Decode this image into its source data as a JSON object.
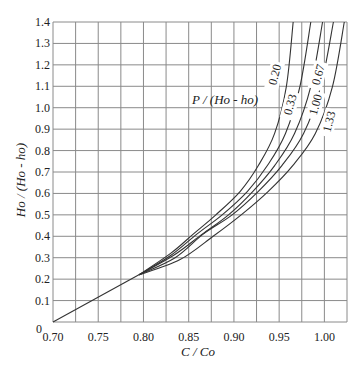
{
  "chart_data": {
    "type": "line",
    "title": "",
    "xlabel": "C / Co",
    "ylabel": "Ho / (Ho - ho)",
    "xlim": [
      0.7,
      1.025
    ],
    "ylim": [
      0,
      1.4
    ],
    "grid": true,
    "x_ticks": [
      "0.70",
      "0.75",
      "0.80",
      "0.85",
      "0.90",
      "0.95",
      "1.00"
    ],
    "y_ticks": [
      "0",
      "0.1",
      "0.2",
      "0.3",
      "0.4",
      "0.5",
      "0.6",
      "0.7",
      "0.8",
      "0.9",
      "1.0",
      "1.1",
      "1.2",
      "1.3",
      "1.4"
    ],
    "legend_title": "P / (Ho - ho)",
    "shared_segment": {
      "x": [
        0.7,
        0.795
      ],
      "y": [
        0.0,
        0.22
      ]
    },
    "series": [
      {
        "name": "0.20",
        "x": [
          0.795,
          0.83,
          0.855,
          0.88,
          0.907,
          0.927,
          0.945,
          0.958,
          0.9655
        ],
        "y": [
          0.22,
          0.32,
          0.41,
          0.5,
          0.61,
          0.73,
          0.88,
          1.1,
          1.4
        ]
      },
      {
        "name": "0.33",
        "x": [
          0.795,
          0.83,
          0.859,
          0.887,
          0.915,
          0.937,
          0.957,
          0.973,
          0.985
        ],
        "y": [
          0.22,
          0.31,
          0.41,
          0.5,
          0.61,
          0.73,
          0.88,
          1.1,
          1.4
        ]
      },
      {
        "name": "0.67",
        "x": [
          0.795,
          0.833,
          0.865,
          0.894,
          0.921,
          0.945,
          0.967,
          0.985,
          0.998
        ],
        "y": [
          0.22,
          0.31,
          0.41,
          0.5,
          0.61,
          0.73,
          0.88,
          1.1,
          1.4
        ]
      },
      {
        "name": "1.00",
        "x": [
          0.795,
          0.835,
          0.866,
          0.898,
          0.927,
          0.953,
          0.977,
          0.996,
          1.01
        ],
        "y": [
          0.22,
          0.3,
          0.41,
          0.5,
          0.61,
          0.73,
          0.88,
          1.1,
          1.4
        ]
      },
      {
        "name": "1.33",
        "x": [
          0.795,
          0.84,
          0.877,
          0.908,
          0.938,
          0.965,
          0.99,
          1.009,
          1.022
        ],
        "y": [
          0.22,
          0.29,
          0.4,
          0.5,
          0.61,
          0.73,
          0.88,
          1.1,
          1.4
        ]
      }
    ],
    "curve_labels": [
      {
        "text": "0.20",
        "x": 0.945,
        "y": 1.15
      },
      {
        "text": "0.33",
        "x": 0.962,
        "y": 1.01
      },
      {
        "text": "0.67",
        "x": 0.993,
        "y": 1.15
      },
      {
        "text": "1.00",
        "x": 0.99,
        "y": 1.01
      },
      {
        "text": "1.33",
        "x": 1.005,
        "y": 0.93
      }
    ]
  },
  "labels": {
    "x_axis": "C / Co",
    "y_axis_main": "Ho / (Ho - ho)",
    "legend_title": "P / (Ho - ho)"
  },
  "colors": {
    "grid": "#8a8a8a",
    "curve": "#333333",
    "text": "#222222"
  }
}
